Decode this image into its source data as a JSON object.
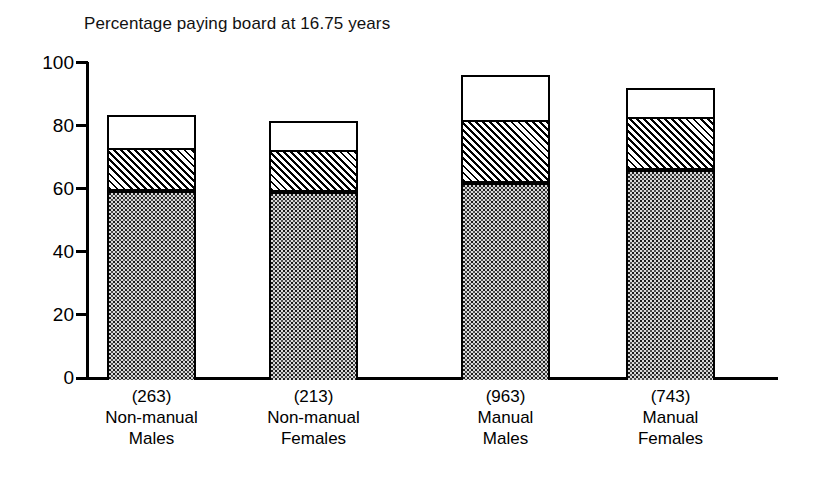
{
  "chart_data": {
    "type": "bar",
    "subtype": "stacked-bar",
    "title": "Percentage paying board at 16.75 years",
    "xlabel": "",
    "ylabel": "",
    "ylim": [
      0,
      100
    ],
    "yticks": [
      0,
      20,
      40,
      60,
      80,
      100
    ],
    "ytick_labels": [
      "0",
      "20",
      "40",
      "60",
      "80",
      "100"
    ],
    "grid": false,
    "legend": "none",
    "categories": [
      "Non-manual Males",
      "Non-manual Females",
      "Manual Males",
      "Manual Females"
    ],
    "category_counts": [
      "(263)",
      "(213)",
      "(963)",
      "(743)"
    ],
    "series": [
      {
        "name": "stippled",
        "pattern": "dotted",
        "values": [
          60.0,
          59.5,
          62.5,
          66.5
        ]
      },
      {
        "name": "hatched",
        "pattern": "diagonal-hatch",
        "values": [
          13.5,
          13.5,
          20.0,
          17.0
        ]
      },
      {
        "name": "open",
        "pattern": "white",
        "values": [
          10.0,
          8.5,
          13.5,
          8.5
        ]
      }
    ],
    "cumulative_tops": [
      [
        60.0,
        73.5,
        83.5
      ],
      [
        59.5,
        73.0,
        81.5
      ],
      [
        62.5,
        82.5,
        96.0
      ],
      [
        66.5,
        83.5,
        92.0
      ]
    ],
    "totals": [
      83.5,
      81.5,
      96.0,
      92.0
    ]
  },
  "bars": [
    {
      "count": "(263)",
      "line1": "Non-manual",
      "line2": "Males",
      "bottom": 60.0,
      "middle": 73.5,
      "top": 83.5
    },
    {
      "count": "(213)",
      "line1": "Non-manual",
      "line2": "Females",
      "bottom": 59.5,
      "middle": 73.0,
      "top": 81.5
    },
    {
      "count": "(963)",
      "line1": "Manual",
      "line2": "Males",
      "bottom": 62.5,
      "middle": 82.5,
      "top": 96.0
    },
    {
      "count": "(743)",
      "line1": "Manual",
      "line2": "Females",
      "bottom": 66.5,
      "middle": 83.5,
      "top": 92.0
    }
  ],
  "colors": {
    "axis": "#000000",
    "text": "#000000",
    "background": "#ffffff",
    "stipple_fill": "#d9d9d9",
    "hatch_fill": "#ffffff",
    "open_fill": "#ffffff"
  }
}
